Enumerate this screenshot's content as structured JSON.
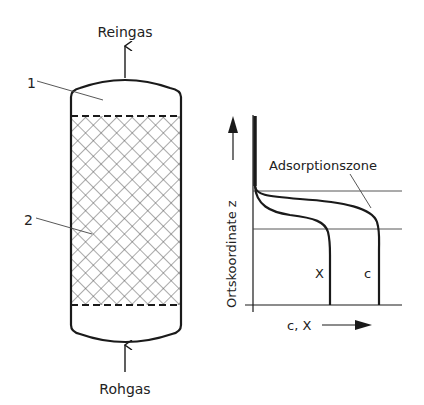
{
  "column": {
    "outlet_label": "Reingas",
    "inlet_label": "Rohgas",
    "callouts": [
      {
        "id": "1",
        "label": "1",
        "meaning": "free space"
      },
      {
        "id": "2",
        "label": "2",
        "meaning": "adsorbent bed"
      }
    ]
  },
  "profile_plot": {
    "y_axis_label": "Ortskoordinate z",
    "x_axis_label": "c, X",
    "zone_label": "Adsorptionszone",
    "curves": [
      {
        "name": "X",
        "label": "X"
      },
      {
        "name": "c",
        "label": "c"
      }
    ]
  },
  "colors": {
    "line": "#1a1a1a",
    "thin_line": "#444444",
    "hatch": "#555555",
    "background": "#ffffff"
  }
}
